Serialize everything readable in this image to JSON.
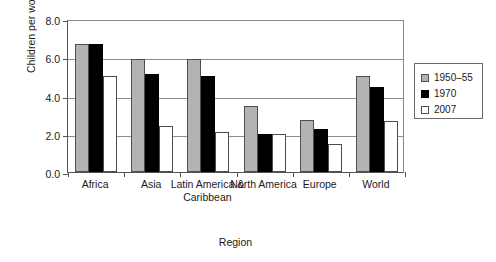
{
  "chart_data": {
    "type": "bar",
    "title": "",
    "subtitle": "",
    "xlabel": "Region",
    "ylabel": "Children per woman",
    "categories": [
      "Africa",
      "Asia",
      "Latin America & Caribbean",
      "North America",
      "Europe",
      "World"
    ],
    "series": [
      {
        "name": "1950–55",
        "color": "#b3b3b3",
        "values": [
          6.7,
          5.9,
          5.9,
          3.45,
          2.7,
          5.0
        ]
      },
      {
        "name": "1970",
        "color": "#000000",
        "values": [
          6.7,
          5.1,
          5.0,
          2.0,
          2.25,
          4.45
        ]
      },
      {
        "name": "2007",
        "color": "#ffffff",
        "values": [
          5.0,
          2.4,
          2.1,
          2.0,
          1.45,
          2.65
        ]
      }
    ],
    "ylim": [
      0.0,
      8.0
    ],
    "yticks": [
      "0.0",
      "2.0",
      "4.0",
      "6.0",
      "8.0"
    ],
    "ytick_values": [
      0.0,
      2.0,
      4.0,
      6.0,
      8.0
    ],
    "grid": true,
    "legend_position": "right"
  },
  "legend": {
    "entries": [
      {
        "label": "1950–55"
      },
      {
        "label": "1970"
      },
      {
        "label": "2007"
      }
    ]
  },
  "axes": {
    "x_title": "Region",
    "y_title": "Children per woman"
  }
}
